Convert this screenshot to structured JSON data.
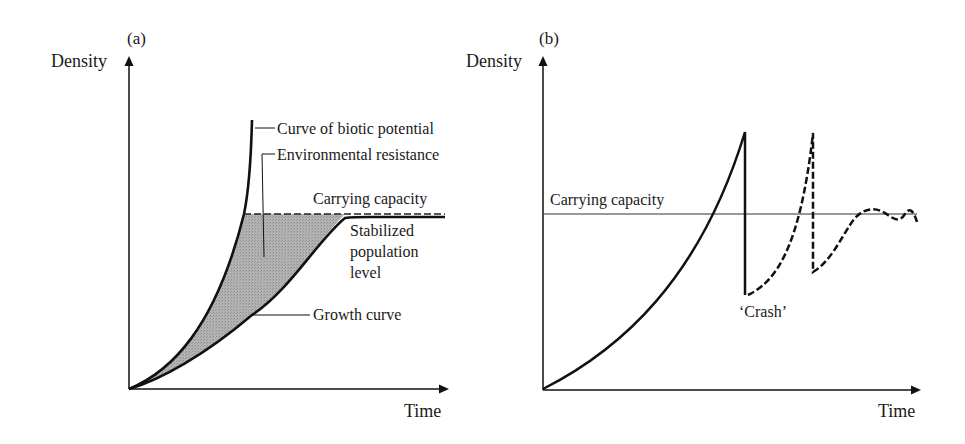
{
  "figure": {
    "panel_a": {
      "id_label": "(a)",
      "y_axis_label": "Density",
      "x_axis_label": "Time",
      "annotations": {
        "biotic_potential": "Curve of biotic potential",
        "environmental_resistance": "Environmental resistance",
        "carrying_capacity": "Carrying capacity",
        "stabilized_line1": "Stabilized",
        "stabilized_line2": "population",
        "stabilized_line3": "level",
        "growth_curve": "Growth curve"
      },
      "colors": {
        "line": "#111111",
        "shaded_area": "#a9a9a9"
      }
    },
    "panel_b": {
      "id_label": "(b)",
      "y_axis_label": "Density",
      "x_axis_label": "Time",
      "annotations": {
        "carrying_capacity": "Carrying capacity",
        "crash": "‘Crash’"
      },
      "colors": {
        "line": "#111111",
        "capacity_line": "#333333"
      }
    }
  }
}
